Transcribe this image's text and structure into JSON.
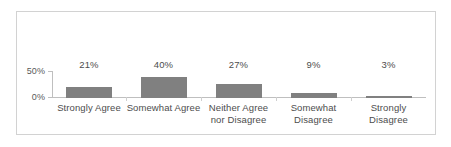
{
  "chart_data": {
    "type": "bar",
    "title": "",
    "subtitle": "",
    "xlabel": "",
    "ylabel": "",
    "categories": [
      "Strongly Agree",
      "Somewhat Agree",
      "Neither Agree nor Disagree",
      "Somewhat Disagree",
      "Strongly Disagree"
    ],
    "category_lines": [
      [
        "Strongly Agree"
      ],
      [
        "Somewhat Agree"
      ],
      [
        "Neither Agree",
        "nor Disagree"
      ],
      [
        "Somewhat",
        "Disagree"
      ],
      [
        "Strongly Disagree"
      ]
    ],
    "values": [
      21,
      40,
      27,
      9,
      3
    ],
    "value_labels": [
      "21%",
      "40%",
      "27%",
      "9%",
      "3%"
    ],
    "ylim": [
      0,
      50
    ],
    "y_ticks": [
      0,
      50
    ],
    "y_tick_labels": [
      "0%",
      "50%"
    ],
    "grid": false,
    "legend": false,
    "legend_position": "none",
    "series": [
      {
        "name": "Response share",
        "values": [
          21,
          40,
          27,
          9,
          3
        ]
      }
    ],
    "colors": {
      "bar": "#808080",
      "axis": "#bfbfbf",
      "text": "#4d4d4d",
      "frame": "#d2d2d2",
      "background": "#ffffff"
    }
  }
}
